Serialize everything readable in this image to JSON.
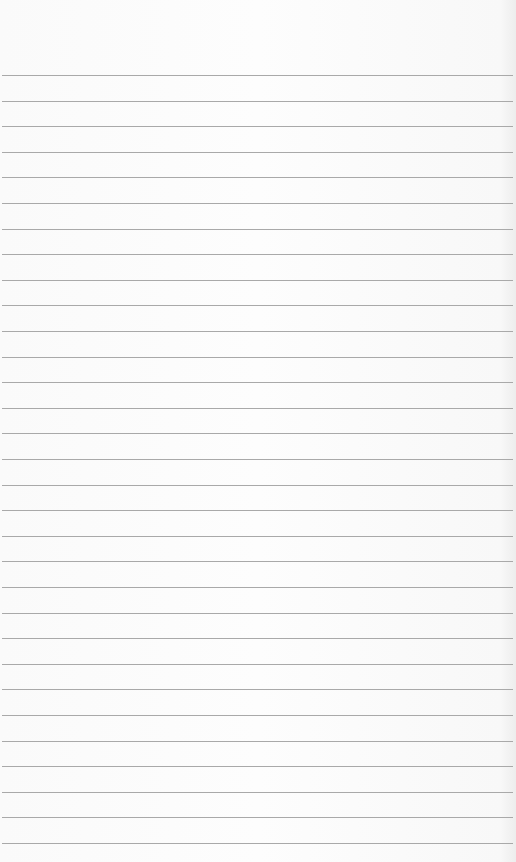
{
  "page": {
    "type": "lined-paper",
    "background_color": "#fbfbfb",
    "line_color": "#a9a9a9",
    "first_line_y": 75,
    "line_spacing": 25.6,
    "line_count": 31
  }
}
